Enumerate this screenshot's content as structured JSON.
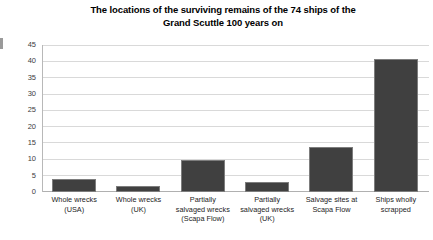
{
  "chart_data": {
    "type": "bar",
    "title": "The locations of the surviving remains of the 74 ships of the Grand Scuttle 100 years on",
    "title_lines": [
      "The locations of the surviving remains of the 74 ships of the",
      "Grand Scuttle 100 years on"
    ],
    "xlabel": "",
    "ylabel": "",
    "ylim": [
      0,
      45
    ],
    "ytick_step": 5,
    "yticks": [
      "45",
      "40",
      "35",
      "30",
      "25",
      "20",
      "15",
      "10",
      "5",
      "0"
    ],
    "grid": true,
    "legend": "none",
    "bar_color": "#404040",
    "bar_border_color": "#7d7d7d",
    "gridline_color": "#d9d9d9",
    "categories": [
      "Whole wrecks (USA)",
      "Whole wrecks (UK)",
      "Partially salvaged wrecks (Scapa Flow)",
      "Partially salvaged wrecks (UK)",
      "Salvage sites at Scapa Flow",
      "Ships wholly scrapped"
    ],
    "category_lines": [
      [
        "Whole wrecks",
        "(USA)"
      ],
      [
        "Whole wrecks",
        "(UK)"
      ],
      [
        "Partially",
        "salvaged wrecks",
        "(Scapa Flow)"
      ],
      [
        "Partially",
        "salvaged wrecks",
        "(UK)"
      ],
      [
        "Salvage sites at",
        "Scapa Flow"
      ],
      [
        "Ships wholly",
        "scrapped"
      ]
    ],
    "values": [
      4,
      2,
      10,
      3,
      14,
      41
    ]
  }
}
